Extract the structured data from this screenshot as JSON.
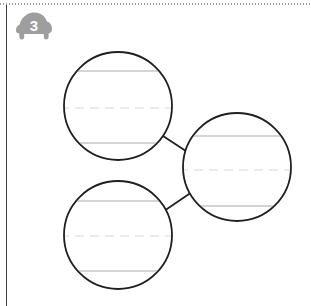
{
  "page": {
    "width": 311,
    "height": 306,
    "background_color": "#ffffff",
    "type": "worksheet"
  },
  "top_perforation": {
    "style": "dotted",
    "color": "#9b9b9b"
  },
  "margin_rule": {
    "color": "#3a3a3a"
  },
  "exercise_badge": {
    "number": "3",
    "shape": "car-silhouette",
    "fill_color": "#9e9e9e",
    "text_color": "#ffffff"
  },
  "diagram": {
    "type": "connected-circles-writing-lines",
    "circle_stroke_color": "#1f1f1f",
    "circle_stroke_width": 1.8,
    "circle_fill_color": "#ffffff",
    "connector_color": "#1f1f1f",
    "connector_width": 1.8,
    "baseline_color": "#a9a9a9",
    "midline_color": "#d8d8d8",
    "midline_style": "dashed",
    "circles": [
      {
        "id": "circle-top-left",
        "label": "top-left-circle",
        "cx": 118,
        "cy": 106,
        "r": 54,
        "top_line_y": 71,
        "mid_line_y": 108,
        "bottom_line_y": 143,
        "content": ""
      },
      {
        "id": "circle-right",
        "label": "right-circle",
        "cx": 237,
        "cy": 167,
        "r": 54,
        "top_line_y": 136,
        "mid_line_y": 170,
        "bottom_line_y": 206,
        "content": ""
      },
      {
        "id": "circle-bottom-left",
        "label": "bottom-left-circle",
        "cx": 118,
        "cy": 235,
        "r": 54,
        "top_line_y": 201,
        "mid_line_y": 236,
        "bottom_line_y": 271,
        "content": ""
      }
    ],
    "connectors": [
      {
        "id": "connector-top-left-to-right",
        "from": "circle-top-left",
        "to": "circle-right",
        "x1": 163,
        "y1": 136,
        "x2": 192,
        "y2": 155
      },
      {
        "id": "connector-bottom-left-to-right",
        "from": "circle-bottom-left",
        "to": "circle-right",
        "x1": 164,
        "y1": 211,
        "x2": 192,
        "y2": 192
      }
    ]
  }
}
